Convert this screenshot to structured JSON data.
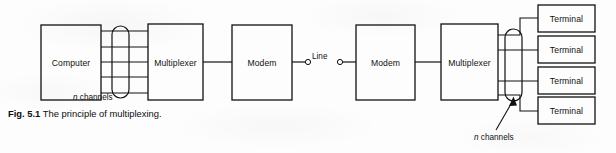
{
  "figure": {
    "caption_number": "Fig. 5.1",
    "caption_text": "The principle of multiplexing."
  },
  "diagram": {
    "type": "block-diagram",
    "nodes": [
      {
        "id": "computer",
        "label": "Computer",
        "x": 41,
        "y": 25,
        "w": 60,
        "h": 75
      },
      {
        "id": "multiplexer-l",
        "label": "Multiplexer",
        "x": 148,
        "y": 24,
        "w": 55,
        "h": 76
      },
      {
        "id": "modem-l",
        "label": "Modem",
        "x": 232,
        "y": 25,
        "w": 60,
        "h": 75
      },
      {
        "id": "modem-r",
        "label": "Modem",
        "x": 356,
        "y": 25,
        "w": 59,
        "h": 75
      },
      {
        "id": "multiplexer-r",
        "label": "Multiplexer",
        "x": 441,
        "y": 24,
        "w": 57,
        "h": 76
      },
      {
        "id": "terminal-1",
        "label": "Terminal",
        "x": 538,
        "y": 5,
        "w": 57,
        "h": 27
      },
      {
        "id": "terminal-2",
        "label": "Terminal",
        "x": 538,
        "y": 36,
        "w": 57,
        "h": 27
      },
      {
        "id": "terminal-3",
        "label": "Terminal",
        "x": 538,
        "y": 67,
        "w": 57,
        "h": 27
      },
      {
        "id": "terminal-4",
        "label": "Terminal",
        "x": 538,
        "y": 97,
        "w": 57,
        "h": 27
      }
    ],
    "annotations": [
      {
        "id": "n-channels-left",
        "prefix": "n",
        "text": " channels",
        "x": 73,
        "y": 93
      },
      {
        "id": "n-channels-right",
        "prefix": "n",
        "text": " channels",
        "x": 474,
        "y": 133
      },
      {
        "id": "line-label",
        "text": "Line",
        "x": 312,
        "y": 52
      }
    ],
    "channel_bundle_left": {
      "count": 5
    },
    "channel_bundle_right": {
      "count": 4
    },
    "colors": {
      "stroke": "#111111",
      "background": "#fdfdfd",
      "text": "#111111"
    }
  }
}
